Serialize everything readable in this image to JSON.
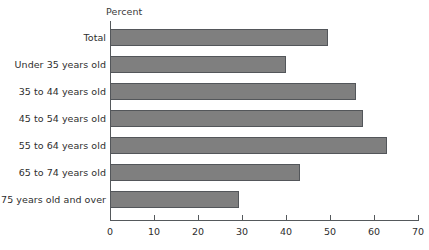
{
  "chart_data": {
    "type": "bar",
    "orientation": "horizontal",
    "title": "",
    "xlabel": "Percent",
    "ylabel": "",
    "xlim": [
      0,
      70
    ],
    "xticks": [
      0,
      10,
      20,
      30,
      40,
      50,
      60,
      70
    ],
    "grid": false,
    "legend": null,
    "bar_color": "#7f7f7f",
    "bar_edge_color": "#53565a",
    "axis_color": "#55595c",
    "text_color": "#2e2e2e",
    "categories": [
      "Total",
      "Under 35 years old",
      "35 to 44 years old",
      "45 to 54 years old",
      "55 to 64 years old",
      "65 to 74 years old",
      "75 years old and over"
    ],
    "values": [
      49.5,
      40.0,
      56.0,
      57.5,
      63.0,
      43.2,
      29.3
    ]
  },
  "axis": {
    "percent_label": "Percent",
    "tick_labels": [
      "0",
      "10",
      "20",
      "30",
      "40",
      "50",
      "60",
      "70"
    ]
  },
  "categories": [
    {
      "label": "Total",
      "value": 49.5
    },
    {
      "label": "Under 35 years old",
      "value": 40.0
    },
    {
      "label": "35 to 44 years old",
      "value": 56.0
    },
    {
      "label": "45 to 54 years old",
      "value": 57.5
    },
    {
      "label": "55 to 64 years old",
      "value": 63.0
    },
    {
      "label": "65 to 74 years old",
      "value": 43.2
    },
    {
      "label": "75 years old and over",
      "value": 29.3
    }
  ]
}
